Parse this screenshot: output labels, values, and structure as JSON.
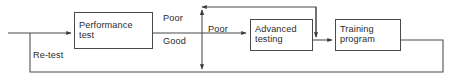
{
  "diagram": {
    "type": "flowchart",
    "colors": {
      "line": "#4a4a4a",
      "text": "#2b2b2b",
      "background": "#ffffff"
    },
    "nodes": [
      {
        "id": "performance-test",
        "line1": "Performance",
        "line2": "test",
        "x": 74,
        "y": 12,
        "width": 79,
        "height": 37
      },
      {
        "id": "advanced-testing",
        "line1": "Advanced",
        "line2": "testing",
        "x": 250,
        "y": 19,
        "width": 63,
        "height": 32
      },
      {
        "id": "training-program",
        "line1": "Training",
        "line2": "program",
        "x": 335,
        "y": 19,
        "width": 66,
        "height": 32
      }
    ],
    "edge_labels": [
      {
        "id": "label-poor-upper",
        "text": "Poor",
        "x": 163,
        "y": 14
      },
      {
        "id": "label-good",
        "text": "Good",
        "x": 163,
        "y": 37
      },
      {
        "id": "label-poor-advanced",
        "text": "Poor",
        "x": 208,
        "y": 25
      },
      {
        "id": "label-re-test",
        "text": "Re-test",
        "x": 33,
        "y": 51
      }
    ],
    "connectors": [
      {
        "id": "input-entry",
        "from": "external-input",
        "to": "performance-test"
      },
      {
        "id": "performance-to-branch",
        "from": "performance-test",
        "to": "branch-junction"
      },
      {
        "id": "branch-to-advanced",
        "from": "branch-junction",
        "to": "advanced-testing"
      },
      {
        "id": "advanced-to-training",
        "from": "advanced-testing",
        "to": "training-program"
      },
      {
        "id": "training-feedback-bottom",
        "from": "training-program",
        "to": "re-test-loop"
      },
      {
        "id": "advanced-feedback-top",
        "from": "advanced-testing",
        "to": "branch-junction-up"
      },
      {
        "id": "branch-down-to-return",
        "from": "branch-junction",
        "to": "return-line"
      }
    ]
  }
}
